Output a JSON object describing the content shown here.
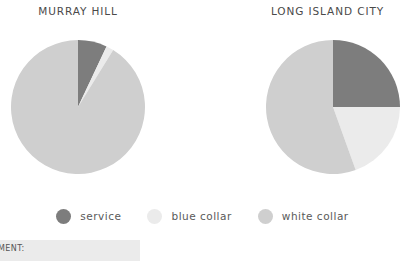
{
  "charts": [
    {
      "title": "MURRAY HILL",
      "slices": [
        {
          "label": "service",
          "value": 7.0,
          "color": "#7d7d7d"
        },
        {
          "label": "blue collar",
          "value": 1.8,
          "color": "#ebebeb"
        },
        {
          "label": "white collar",
          "value": 91.2,
          "color": "#cfcfcf"
        }
      ]
    },
    {
      "title": "LONG ISLAND CITY",
      "slices": [
        {
          "label": "service",
          "value": 25.0,
          "color": "#7d7d7d"
        },
        {
          "label": "blue collar",
          "value": 19.5,
          "color": "#ebebeb"
        },
        {
          "label": "white collar",
          "value": 55.5,
          "color": "#cfcfcf"
        }
      ]
    }
  ],
  "legend": {
    "items": [
      {
        "label": "service",
        "color": "#7d7d7d"
      },
      {
        "label": "blue collar",
        "color": "#ebebeb"
      },
      {
        "label": "white collar",
        "color": "#cfcfcf"
      }
    ]
  },
  "caption": {
    "text": "MENT:"
  },
  "colors": {
    "service": "#7d7d7d",
    "blue_collar": "#ebebeb",
    "white_collar": "#cfcfcf",
    "text": "#4a4a4a",
    "caption_background": "#ebebeb",
    "page_background": "#ffffff"
  },
  "chart_data": [
    {
      "type": "pie",
      "title": "MURRAY HILL",
      "categories": [
        "service",
        "blue collar",
        "white collar"
      ],
      "values": [
        7.0,
        1.8,
        91.2
      ],
      "units": "percent",
      "start_angle": 0,
      "direction": "clockwise",
      "colors": [
        "#7d7d7d",
        "#ebebeb",
        "#cfcfcf"
      ],
      "legend_position": "bottom",
      "grid": false,
      "xlabel": "",
      "ylabel": ""
    },
    {
      "type": "pie",
      "title": "LONG ISLAND CITY",
      "categories": [
        "service",
        "blue collar",
        "white collar"
      ],
      "values": [
        25.0,
        19.5,
        55.5
      ],
      "units": "percent",
      "start_angle": 0,
      "direction": "clockwise",
      "colors": [
        "#7d7d7d",
        "#ebebeb",
        "#cfcfcf"
      ],
      "legend_position": "bottom",
      "grid": false,
      "xlabel": "",
      "ylabel": ""
    }
  ]
}
